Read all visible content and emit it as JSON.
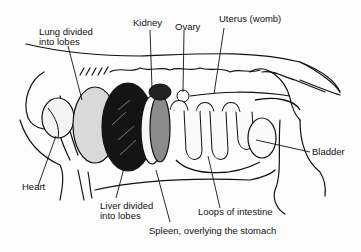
{
  "diagram": {
    "labels": {
      "lung": "Lung divided into lobes",
      "lung_line1": "Lung divided",
      "lung_line2": "into lobes",
      "kidney": "Kidney",
      "ovary": "Ovary",
      "uterus": "Uterus (womb)",
      "bladder": "Bladder",
      "heart": "Heart",
      "liver_line1": "Liver divided",
      "liver_line2": "into lobes",
      "intestine": "Loops of intestine",
      "spleen": "Spleen, overlying the stomach"
    },
    "colors": {
      "ink": "#111111",
      "lung_fill": "#d9d9d9",
      "liver_fill": "#141414",
      "spleen_fill": "#8a8a8a",
      "background": "#fdfdfd"
    }
  }
}
